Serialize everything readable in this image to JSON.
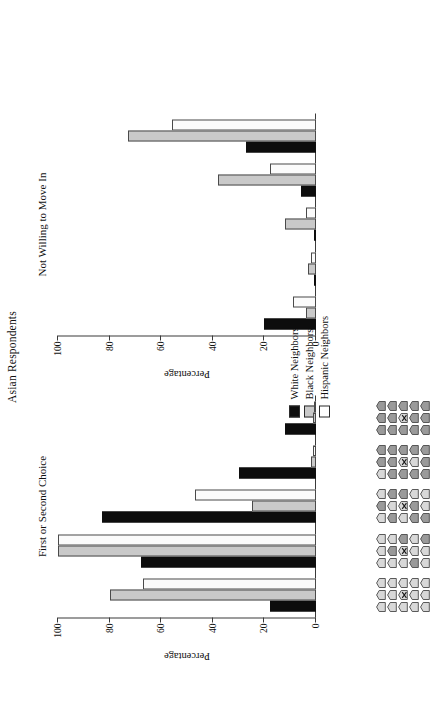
{
  "figure": {
    "title": "Asian Respondents",
    "axis_label": "Percentage",
    "y_ticks": [
      "0",
      "20",
      "40",
      "60",
      "80",
      "100"
    ]
  },
  "legend": {
    "items": [
      {
        "label": "White Neighbors",
        "key": "white",
        "color": "#0d0d0d"
      },
      {
        "label": "Black Neighbors",
        "key": "black",
        "color": "#c9c9c9"
      },
      {
        "label": "Hispanic Neighbors",
        "key": "hispanic",
        "color": "#ffffff"
      }
    ]
  },
  "panels": [
    {
      "id": "left",
      "title": "First or Second Choice"
    },
    {
      "id": "right",
      "title": "Not Willing to Move In"
    }
  ],
  "neighborhood_icons": {
    "description": "Five neighborhood cards, each a 5-row by 3-column grid of house glyphs; the centre house is marked with an X to denote the respondent's own home. Shading darkens left to right as the share of out-group neighbors rises.",
    "cards": [
      {
        "out_group_houses": 0,
        "own_home_index": 7
      },
      {
        "out_group_houses": 3,
        "own_home_index": 7
      },
      {
        "out_group_houses": 7,
        "own_home_index": 7
      },
      {
        "out_group_houses": 10,
        "own_home_index": 7
      },
      {
        "out_group_houses": 14,
        "own_home_index": 7
      }
    ]
  },
  "chart_data": [
    {
      "type": "bar",
      "title": "First or Second Choice",
      "xlabel": "",
      "ylabel": "Percentage",
      "ylim": [
        0,
        100
      ],
      "yticks": [
        0,
        20,
        40,
        60,
        80,
        100
      ],
      "grid": false,
      "legend_position": "top-center",
      "categories": [
        "Neighborhood 1",
        "Neighborhood 2",
        "Neighborhood 3",
        "Neighborhood 4",
        "Neighborhood 5"
      ],
      "series": [
        {
          "name": "White Neighbors",
          "values": [
            18,
            68,
            83,
            30,
            12
          ]
        },
        {
          "name": "Black Neighbors",
          "values": [
            80,
            100,
            25,
            2,
            1
          ]
        },
        {
          "name": "Hispanic Neighbors",
          "values": [
            67,
            100,
            47,
            1,
            0
          ]
        }
      ]
    },
    {
      "type": "bar",
      "title": "Not Willing to Move In",
      "xlabel": "",
      "ylabel": "Percentage",
      "ylim": [
        0,
        100
      ],
      "yticks": [
        0,
        20,
        40,
        60,
        80,
        100
      ],
      "grid": false,
      "legend_position": "top-center",
      "categories": [
        "Neighborhood 1",
        "Neighborhood 2",
        "Neighborhood 3",
        "Neighborhood 4",
        "Neighborhood 5"
      ],
      "series": [
        {
          "name": "White Neighbors",
          "values": [
            20,
            0,
            0,
            6,
            27
          ]
        },
        {
          "name": "Black Neighbors",
          "values": [
            4,
            3,
            12,
            38,
            73
          ]
        },
        {
          "name": "Hispanic Neighbors",
          "values": [
            9,
            2,
            4,
            18,
            56
          ]
        }
      ]
    }
  ]
}
